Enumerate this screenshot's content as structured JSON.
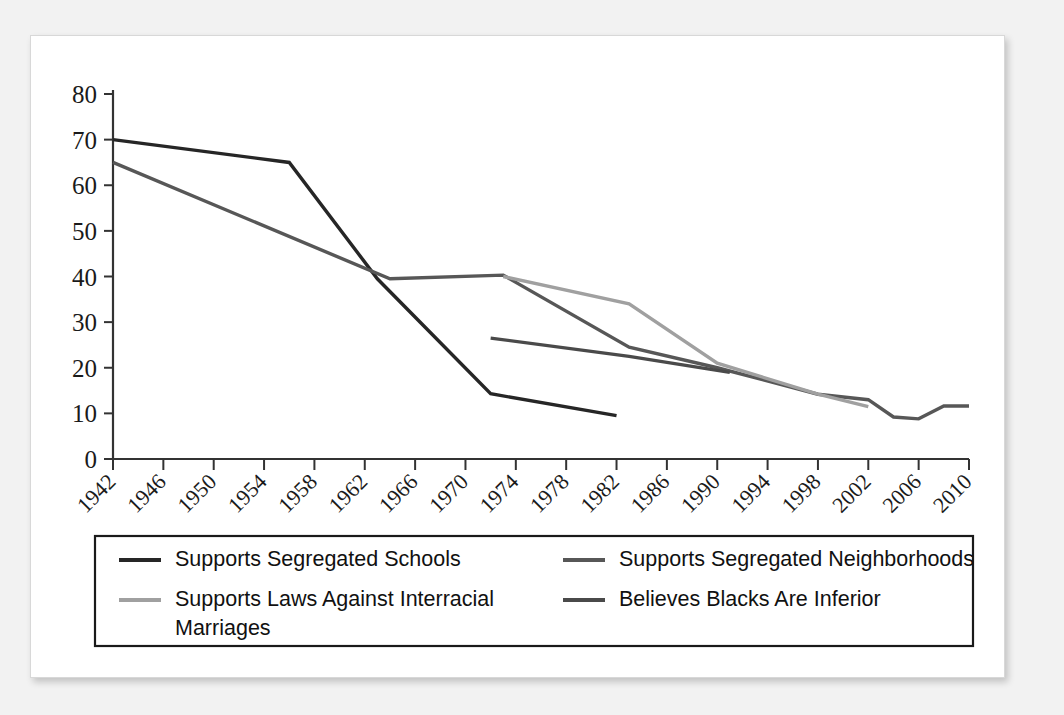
{
  "figure": {
    "background_color": "#f2f2f2",
    "card_color": "#ffffff"
  },
  "chart_data": {
    "type": "line",
    "title": "",
    "subtitle": "",
    "xlabel": "",
    "ylabel": "",
    "xlim": [
      1942,
      2010
    ],
    "ylim": [
      0,
      80
    ],
    "grid": false,
    "legend_position": "bottom",
    "y_ticks": [
      0,
      10,
      20,
      30,
      40,
      50,
      60,
      70,
      80
    ],
    "y_tick_labels": [
      "0",
      "10",
      "20",
      "30",
      "40",
      "50",
      "60",
      "70",
      "80"
    ],
    "x_ticks": [
      1942,
      1946,
      1950,
      1954,
      1958,
      1962,
      1966,
      1970,
      1974,
      1978,
      1982,
      1986,
      1990,
      1994,
      1998,
      2002,
      2006,
      2010
    ],
    "x_tick_labels": [
      "1942",
      "1946",
      "1950",
      "1954",
      "1958",
      "1962",
      "1966",
      "1970",
      "1974",
      "1978",
      "1982",
      "1986",
      "1990",
      "1994",
      "1998",
      "2002",
      "2006",
      "2010"
    ],
    "series": [
      {
        "name": "Supports Segregated Schools",
        "color": "#262626",
        "width": 3.4,
        "points": [
          [
            1942,
            70.0
          ],
          [
            1956,
            65.0
          ],
          [
            1963,
            39.5
          ],
          [
            1972,
            14.3
          ],
          [
            1982,
            9.5
          ]
        ]
      },
      {
        "name": "Supports Segregated Neighborhoods",
        "color": "#575757",
        "width": 3.4,
        "points": [
          [
            1942,
            65.0
          ],
          [
            1964,
            39.5
          ],
          [
            1973,
            40.3
          ],
          [
            1983,
            24.5
          ],
          [
            1990,
            20.0
          ],
          [
            1998,
            14.2
          ],
          [
            2002,
            13.0
          ],
          [
            2004,
            9.2
          ],
          [
            2006,
            8.8
          ],
          [
            2008,
            11.6
          ],
          [
            2010,
            11.6
          ]
        ]
      },
      {
        "name": "Supports Laws Against Interracial Marriages",
        "color": "#a0a0a0",
        "width": 3.4,
        "points": [
          [
            1973,
            40.0
          ],
          [
            1983,
            34.0
          ],
          [
            1990,
            21.0
          ],
          [
            1998,
            14.2
          ],
          [
            2002,
            11.5
          ]
        ]
      },
      {
        "name": "Believes Blacks Are Inferior",
        "color": "#4a4a4a",
        "width": 3.2,
        "points": [
          [
            1972,
            26.5
          ],
          [
            1983,
            22.5
          ],
          [
            1991,
            19.0
          ]
        ]
      }
    ]
  },
  "legend": {
    "entries": [
      {
        "label": "Supports Segregated Schools",
        "color": "#262626"
      },
      {
        "label": "Supports Segregated Neighborhoods",
        "color": "#575757"
      },
      {
        "label": "Supports Laws Against Interracial",
        "label_line2": "Marriages",
        "color": "#a0a0a0"
      },
      {
        "label": "Believes Blacks Are Inferior",
        "color": "#4a4a4a"
      }
    ]
  }
}
